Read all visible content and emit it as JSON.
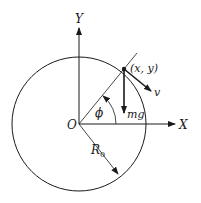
{
  "diagram": {
    "title": "",
    "labels": {
      "y_axis": "Y",
      "x_axis": "X",
      "origin": "O",
      "point": "(x, y)",
      "velocity": "v",
      "weight": "mg",
      "angle": "ϕ",
      "radius": "R",
      "radius_subscript": "0"
    },
    "colors": {
      "stroke": "#1a1a1a",
      "background": "#ffffff"
    },
    "geometry": {
      "origin": [
        79,
        124
      ],
      "circle_radius": 67,
      "point": [
        124,
        69
      ],
      "angle_deg": 50
    }
  }
}
